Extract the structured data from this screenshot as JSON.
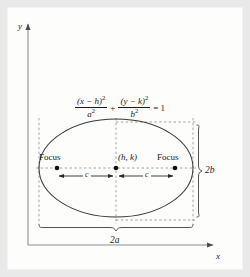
{
  "figure": {
    "type": "ellipse-diagram",
    "background_color": "#e9e9e9",
    "page_color": "#fdfdfc",
    "ink_color": "#1a1a1a"
  },
  "axes": {
    "y_label": "y",
    "x_label": "x",
    "y_axis": {
      "x": 28,
      "y_top": 22,
      "y_bottom": 245
    },
    "x_axis": {
      "y": 245,
      "x_left": 28,
      "x_right": 215
    }
  },
  "equation": {
    "numerator_1": "(x − h)",
    "numerator_1_exponent": "2",
    "denominator_1": "a",
    "denominator_1_exponent": "2",
    "operator": "+",
    "numerator_2": "(y − k)",
    "numerator_2_exponent": "2",
    "denominator_2": "b",
    "denominator_2_exponent": "2",
    "equals": "= 1",
    "plain_text": "(x - h)^2 / a^2 + (y - k)^2 / b^2 = 1"
  },
  "ellipse": {
    "center_x": 116,
    "center_y": 168,
    "semi_major_a": 77,
    "semi_minor_b": 50,
    "stroke_color": "#3a3a3a"
  },
  "points": {
    "center": {
      "label": "(h, k)",
      "x": 116,
      "y": 168
    },
    "focus_left": {
      "label": "Focus",
      "x": 57,
      "y": 168
    },
    "focus_right": {
      "label": "Focus",
      "x": 175,
      "y": 168
    }
  },
  "measures": {
    "c_left": "c",
    "c_right": "c",
    "width_label": "2a",
    "height_label": "2b"
  },
  "bounding_box": {
    "left": 39,
    "right": 193,
    "top": 122,
    "bottom": 220,
    "style": "dashed"
  },
  "braces": {
    "vertical_brace_x": 200,
    "vertical_brace_top": 122,
    "vertical_brace_bottom": 220,
    "horizontal_brace_y": 228,
    "horizontal_brace_left": 39,
    "horizontal_brace_right": 193
  }
}
